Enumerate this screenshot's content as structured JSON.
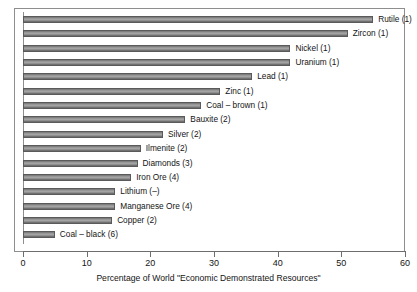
{
  "chart_data": {
    "type": "bar",
    "orientation": "horizontal",
    "title": "",
    "xlabel": "Percentage of World \"Economic Demonstrated Resources\"",
    "ylabel": "",
    "xlim": [
      0,
      60
    ],
    "xticks": [
      0,
      10,
      20,
      30,
      40,
      50,
      60
    ],
    "grid": false,
    "legend": null,
    "categories": [
      "Rutile (1)",
      "Zircon (1)",
      "Nickel (1)",
      "Uranium (1)",
      "Lead (1)",
      "Zinc (1)",
      "Coal – brown (1)",
      "Bauxite (2)",
      "Silver (2)",
      "Ilmenite (2)",
      "Diamonds (3)",
      "Iron Ore (4)",
      "Lithium (–)",
      "Manganese Ore (4)",
      "Copper (2)",
      "Coal – black (6)"
    ],
    "values": [
      55,
      51,
      42,
      42,
      36,
      31,
      28,
      25.5,
      22,
      18.5,
      18,
      17,
      14.5,
      14.5,
      14,
      5
    ]
  },
  "axis": {
    "tick_labels": [
      "0",
      "10",
      "20",
      "30",
      "40",
      "50",
      "60"
    ],
    "title": "Percentage of World \"Economic Demonstrated Resources\""
  },
  "style": {
    "bar_fill": "#a8a8a8",
    "bar_edge": "#5a5a5a",
    "axis_color": "#6d6d6d",
    "frame_color": "#8e8e8e",
    "background": "#ffffff",
    "text_color": "#141414"
  }
}
